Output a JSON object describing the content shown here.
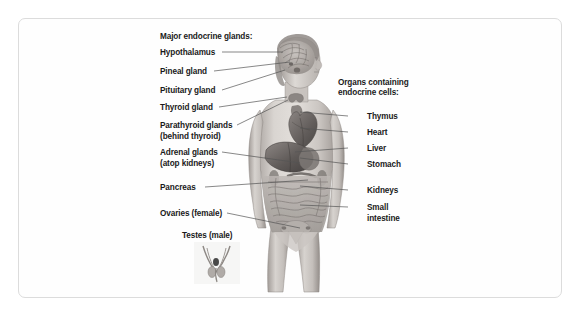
{
  "diagram": {
    "title_left": "Major endocrine glands:",
    "title_right_line1": "Organs containing",
    "title_right_line2": "endocrine cells:",
    "colors": {
      "text": "#1a1a1a",
      "leader_line": "#555555",
      "card_border": "#dcdcdc",
      "card_background": "#fefefe",
      "body_light": "#d8d4d0",
      "body_mid": "#b3aeaa",
      "body_dark": "#8a8582",
      "organ_dark": "#6d6866",
      "organ_mid": "#9a9491"
    },
    "left_labels": [
      {
        "name": "hypothalamus",
        "line1": "Hypothalamus",
        "line2": "",
        "x": 160,
        "y": 48,
        "leader_x1": 222,
        "leader_y1": 52,
        "leader_x2": 283,
        "leader_y2": 52
      },
      {
        "name": "pineal-gland",
        "line1": "Pineal gland",
        "line2": "",
        "x": 160,
        "y": 67,
        "leader_x1": 214,
        "leader_y1": 71,
        "leader_x2": 290,
        "leader_y2": 62
      },
      {
        "name": "pituitary-gland",
        "line1": "Pituitary gland",
        "line2": "",
        "x": 160,
        "y": 86,
        "leader_x1": 222,
        "leader_y1": 90,
        "leader_x2": 285,
        "leader_y2": 70
      },
      {
        "name": "thyroid-gland",
        "line1": "Thyroid gland",
        "line2": "",
        "x": 160,
        "y": 103,
        "leader_x1": 219,
        "leader_y1": 107,
        "leader_x2": 287,
        "leader_y2": 97
      },
      {
        "name": "parathyroid-glands",
        "line1": "Parathyroid glands",
        "line2": "(behind thyroid)",
        "x": 160,
        "y": 121,
        "leader_x1": 237,
        "leader_y1": 125,
        "leader_x2": 288,
        "leader_y2": 100
      },
      {
        "name": "adrenal-glands",
        "line1": "Adrenal glands",
        "line2": "(atop kidneys)",
        "x": 160,
        "y": 148,
        "leader_x1": 222,
        "leader_y1": 152,
        "leader_x2": 300,
        "leader_y2": 163
      },
      {
        "name": "pancreas",
        "line1": "Pancreas",
        "line2": "",
        "x": 160,
        "y": 183,
        "leader_x1": 205,
        "leader_y1": 187,
        "leader_x2": 308,
        "leader_y2": 180
      },
      {
        "name": "ovaries-female",
        "line1": "Ovaries (female)",
        "line2": "",
        "x": 160,
        "y": 209,
        "leader_x1": 227,
        "leader_y1": 213,
        "leader_x2": 300,
        "leader_y2": 228
      },
      {
        "name": "testes-male",
        "line1": "Testes (male)",
        "line2": "",
        "x": 182,
        "y": 231,
        "leader_x1": 0,
        "leader_y1": 0,
        "leader_x2": 0,
        "leader_y2": 0
      }
    ],
    "right_labels": [
      {
        "name": "thymus",
        "line1": "Thymus",
        "line2": "",
        "x": 367,
        "y": 112,
        "leader_x1": 348,
        "leader_y1": 116,
        "leader_x2": 300,
        "leader_y2": 112
      },
      {
        "name": "heart",
        "line1": "Heart",
        "line2": "",
        "x": 367,
        "y": 128,
        "leader_x1": 348,
        "leader_y1": 132,
        "leader_x2": 300,
        "leader_y2": 128
      },
      {
        "name": "liver",
        "line1": "Liver",
        "line2": "",
        "x": 367,
        "y": 144,
        "leader_x1": 348,
        "leader_y1": 148,
        "leader_x2": 295,
        "leader_y2": 152
      },
      {
        "name": "stomach",
        "line1": "Stomach",
        "line2": "",
        "x": 367,
        "y": 160,
        "leader_x1": 348,
        "leader_y1": 164,
        "leader_x2": 300,
        "leader_y2": 158
      },
      {
        "name": "kidneys",
        "line1": "Kidneys",
        "line2": "",
        "x": 367,
        "y": 186,
        "leader_x1": 348,
        "leader_y1": 190,
        "leader_x2": 300,
        "leader_y2": 186
      },
      {
        "name": "small-intestine",
        "line1": "Small",
        "line2": "intestine",
        "x": 367,
        "y": 203,
        "leader_x1": 348,
        "leader_y1": 207,
        "leader_x2": 300,
        "leader_y2": 205
      }
    ]
  }
}
